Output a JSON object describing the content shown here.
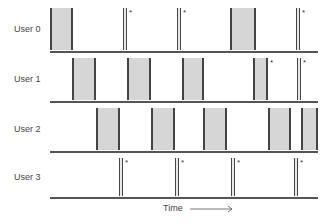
{
  "diagram": {
    "x_axis": {
      "label": "Time",
      "arrow": "right-arrow"
    },
    "rows": [
      {
        "label": "User 0",
        "events": [
          {
            "type": "block",
            "x0": 50,
            "x1": 73,
            "marked": false
          },
          {
            "type": "spike",
            "x": 123,
            "marked": true
          },
          {
            "type": "spike",
            "x": 177,
            "marked": true
          },
          {
            "type": "block",
            "x0": 230,
            "x1": 256,
            "marked": false
          },
          {
            "type": "spike",
            "x": 296,
            "marked": true
          }
        ]
      },
      {
        "label": "User 1",
        "events": [
          {
            "type": "block",
            "x0": 72,
            "x1": 96,
            "marked": false
          },
          {
            "type": "block",
            "x0": 127,
            "x1": 151,
            "marked": false
          },
          {
            "type": "block",
            "x0": 182,
            "x1": 204,
            "marked": false
          },
          {
            "type": "block",
            "x0": 253,
            "x1": 268,
            "marked": true
          },
          {
            "type": "spike",
            "x": 297,
            "marked": true
          }
        ]
      },
      {
        "label": "User 2",
        "events": [
          {
            "type": "block",
            "x0": 96,
            "x1": 120,
            "marked": false
          },
          {
            "type": "block",
            "x0": 151,
            "x1": 175,
            "marked": false
          },
          {
            "type": "block",
            "x0": 203,
            "x1": 227,
            "marked": false
          },
          {
            "type": "block",
            "x0": 268,
            "x1": 291,
            "marked": false
          },
          {
            "type": "block",
            "x0": 301,
            "x1": 318,
            "marked": false
          }
        ]
      },
      {
        "label": "User 3",
        "events": [
          {
            "type": "spike",
            "x": 119,
            "marked": true
          },
          {
            "type": "spike",
            "x": 175,
            "marked": true
          },
          {
            "type": "spike",
            "x": 231,
            "marked": true
          },
          {
            "type": "spike",
            "x": 294,
            "marked": true
          }
        ]
      }
    ],
    "marker_symbol": "*"
  },
  "labels": {
    "user0": "User 0",
    "user1": "User 1",
    "user2": "User 2",
    "user3": "User 3",
    "time": "Time"
  }
}
